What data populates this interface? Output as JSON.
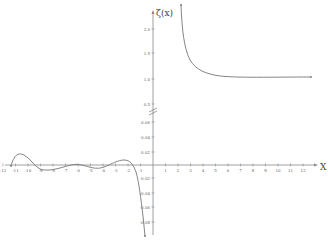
{
  "chart_data": {
    "type": "line",
    "title": "",
    "ylabel": "ζ(x)",
    "xlabel": "X",
    "x_ticks": [
      -12,
      -11,
      -10,
      -9,
      -8,
      -7,
      -6,
      -5,
      -4,
      -3,
      -2,
      -1,
      1,
      2,
      3,
      4,
      5,
      6,
      7,
      8,
      9,
      10,
      11,
      12
    ],
    "y_ticks_upper": [
      "2.0",
      "1.5",
      "1.0",
      "0.5"
    ],
    "y_ticks_lower": [
      "0.06",
      "0.04",
      "0.02",
      "-0.02",
      "-0.04",
      "-0.06",
      "-0.08"
    ],
    "axis_break": true,
    "grid": false,
    "series": [
      {
        "name": "zeta(x), x<1",
        "x": [
          -12,
          -11.3,
          -10,
          -9,
          -8,
          -7,
          -6,
          -5,
          -4,
          -3,
          -2.5,
          -2,
          -1.5,
          -1
        ],
        "y": [
          0.0,
          0.027,
          0.0,
          -0.008,
          -0.004,
          0.004,
          -0.004,
          -0.004,
          0.004,
          0.008,
          0.005,
          0.0,
          -0.04,
          -0.083
        ]
      },
      {
        "name": "zeta(x), x>1",
        "x": [
          1.1,
          1.2,
          1.5,
          2,
          3,
          4,
          5,
          6,
          8,
          10,
          12
        ],
        "y": [
          2.75,
          2.3,
          1.75,
          1.64,
          1.2,
          1.08,
          1.04,
          1.02,
          1.005,
          1.001,
          1.0
        ]
      }
    ],
    "color": "#777777"
  },
  "labels": {
    "y_title": "ζ(x)",
    "x_title": "X"
  }
}
